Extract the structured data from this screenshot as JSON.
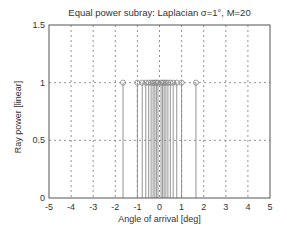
{
  "chart_data": {
    "type": "stem",
    "title": "Equal power subray: Laplacian σ=1°, M=20",
    "xlabel": "Angle of arrival [deg]",
    "ylabel": "Ray power [linear]",
    "xlim": [
      -5,
      5
    ],
    "ylim": [
      0,
      1.5
    ],
    "xticks": [
      "-5",
      "-4",
      "-3",
      "-2",
      "-1",
      "0",
      "1",
      "2",
      "3",
      "4",
      "5"
    ],
    "yticks": [
      "0",
      "0.5",
      "1",
      "1.5"
    ],
    "grid": true,
    "marker": "circle",
    "x": [
      -1.65,
      -1.0,
      -0.78,
      -0.62,
      -0.49,
      -0.38,
      -0.29,
      -0.21,
      -0.14,
      -0.07,
      0.07,
      0.14,
      0.21,
      0.29,
      0.38,
      0.49,
      0.62,
      0.78,
      1.0,
      1.65
    ],
    "values": [
      1,
      1,
      1,
      1,
      1,
      1,
      1,
      1,
      1,
      1,
      1,
      1,
      1,
      1,
      1,
      1,
      1,
      1,
      1,
      1
    ],
    "colors": {
      "axis": "#555555",
      "stem": "#888888",
      "grid": "#777777"
    }
  }
}
